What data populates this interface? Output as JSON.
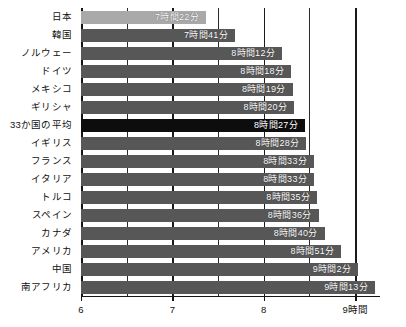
{
  "chart_data": {
    "type": "bar",
    "orientation": "horizontal",
    "title": "",
    "subtitle": "",
    "xlabel": "",
    "ylabel": "",
    "xlim": [
      6,
      9.25
    ],
    "grid": true,
    "grid_interval_hours": 0.5,
    "legend": "none",
    "unit_suffix": "時間",
    "categories": [
      "日本",
      "韓国",
      "ノルウェー",
      "ドイツ",
      "メキシコ",
      "ギリシャ",
      "33か国の平均",
      "イギリス",
      "フランス",
      "イタリア",
      "トルコ",
      "スペイン",
      "カナダ",
      "アメリカ",
      "中国",
      "南アフリカ"
    ],
    "values": [
      7.3667,
      7.6833,
      8.2,
      8.3,
      8.3167,
      8.3333,
      8.45,
      8.4667,
      8.55,
      8.55,
      8.5833,
      8.6,
      8.6667,
      8.85,
      9.0333,
      9.2167
    ],
    "value_labels": [
      "7時間22分",
      "7時間41分",
      "8時間12分",
      "8時間18分",
      "8時間19分",
      "8時間20分",
      "8時間27分",
      "8時間28分",
      "8時間33分",
      "8時間33分",
      "8時間35分",
      "8時間36分",
      "8時間40分",
      "8時間51分",
      "9時間2分",
      "9時間13分"
    ],
    "bar_styles": [
      "light",
      "normal",
      "normal",
      "normal",
      "normal",
      "normal",
      "highlight",
      "normal",
      "normal",
      "normal",
      "normal",
      "normal",
      "normal",
      "normal",
      "normal",
      "normal"
    ],
    "xticks": [
      6,
      7,
      8,
      9
    ],
    "xtick_labels": [
      "6",
      "7",
      "8",
      "9時間"
    ],
    "colors": {
      "bar_normal": "#575757",
      "bar_light": "#a9a9a9",
      "bar_highlight": "#0d0d0d",
      "axis": "#141414",
      "label_text": "#111111",
      "value_text": "#ffffff",
      "background": "#ffffff"
    }
  }
}
